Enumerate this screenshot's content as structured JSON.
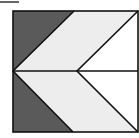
{
  "figure": {
    "colors": {
      "dark": "#5a5a5a",
      "light": "#ededed",
      "white": "#ffffff",
      "stroke": "#111111"
    },
    "marker_line": {
      "x1": 0,
      "y1": 2,
      "x2": 19,
      "y2": 2
    }
  }
}
